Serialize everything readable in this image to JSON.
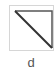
{
  "item": {
    "label": "d",
    "icon": "diagonal-triangle-icon",
    "border_color": "#d6d6d6",
    "stroke_color": "#333333"
  }
}
